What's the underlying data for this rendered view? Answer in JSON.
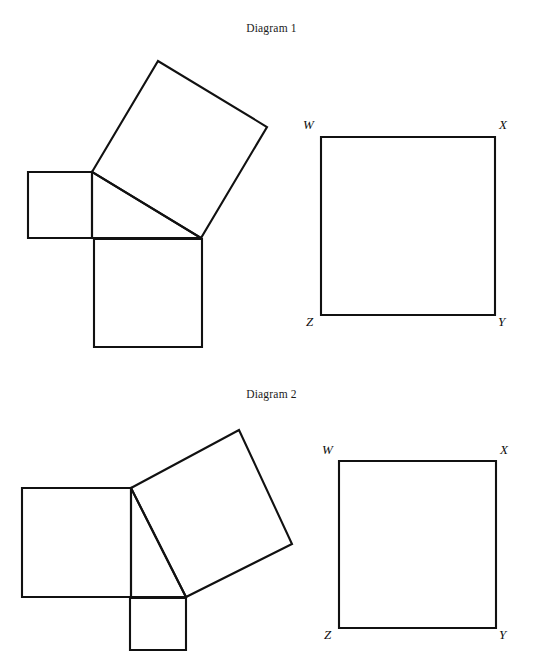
{
  "page": {
    "width": 543,
    "height": 670,
    "background": "#ffffff",
    "ink": "#111111",
    "cut_off_top_line": ""
  },
  "captions": [
    {
      "id": "diagram-1",
      "text": "Diagram 1"
    },
    {
      "id": "diagram-2",
      "text": "Diagram 2"
    }
  ],
  "diagram1": {
    "caption": "Diagram 1",
    "left_figure": {
      "name": "pythagorean-squares-figure",
      "description": "right triangle with a square erected on each of its three sides",
      "triangle": {
        "vertices": [
          [
            92,
            172
          ],
          [
            201,
            238
          ],
          [
            92,
            238
          ]
        ],
        "right_angle_at": [
          92,
          238
        ]
      },
      "squares": [
        {
          "name": "small-square-left",
          "side_label": "short leg",
          "points": "28,172 92,172 92,238 28,238"
        },
        {
          "name": "tilted-square-hypotenuse",
          "side_label": "hypotenuse",
          "points": "92,172 158,61 267,127 201,238"
        },
        {
          "name": "bottom-square-long-leg",
          "side_label": "long leg",
          "points": "94,239 202,239 202,347 94,347"
        }
      ]
    },
    "right_figure": {
      "name": "square-wxyz",
      "points": "321,137 495,137 495,315 321,315",
      "vertex_labels": [
        {
          "label": "W",
          "corner": "top-left",
          "x": 303,
          "y": 118
        },
        {
          "label": "X",
          "corner": "top-right",
          "x": 499,
          "y": 118
        },
        {
          "label": "Z",
          "corner": "bottom-left",
          "x": 306,
          "y": 315
        },
        {
          "label": "Y",
          "corner": "bottom-right",
          "x": 498,
          "y": 315
        }
      ]
    }
  },
  "diagram2": {
    "caption": "Diagram 2",
    "left_figure": {
      "name": "pythagorean-squares-figure",
      "description": "right triangle with a square erected on each of its three sides",
      "triangle": {
        "vertices": [
          [
            131,
            488
          ],
          [
            186,
            597
          ],
          [
            131,
            597
          ]
        ],
        "right_angle_at": [
          131,
          597
        ]
      },
      "squares": [
        {
          "name": "large-square-long-leg",
          "side_label": "long leg",
          "points": "22,488 131,488 131,597 22,597"
        },
        {
          "name": "tilted-square-hypotenuse",
          "side_label": "hypotenuse",
          "points": "131,488 239,430 292,544 186,597"
        },
        {
          "name": "small-square-short-leg",
          "side_label": "short leg",
          "points": "130,598 186,598 186,650 130,650"
        }
      ]
    },
    "right_figure": {
      "name": "square-wxyz",
      "points": "339,461 496,461 496,628 339,628",
      "vertex_labels": [
        {
          "label": "W",
          "corner": "top-left",
          "x": 322,
          "y": 443
        },
        {
          "label": "X",
          "corner": "top-right",
          "x": 500,
          "y": 443
        },
        {
          "label": "Z",
          "corner": "bottom-left",
          "x": 324,
          "y": 628
        },
        {
          "label": "Y",
          "corner": "bottom-right",
          "x": 499,
          "y": 628
        }
      ]
    }
  }
}
